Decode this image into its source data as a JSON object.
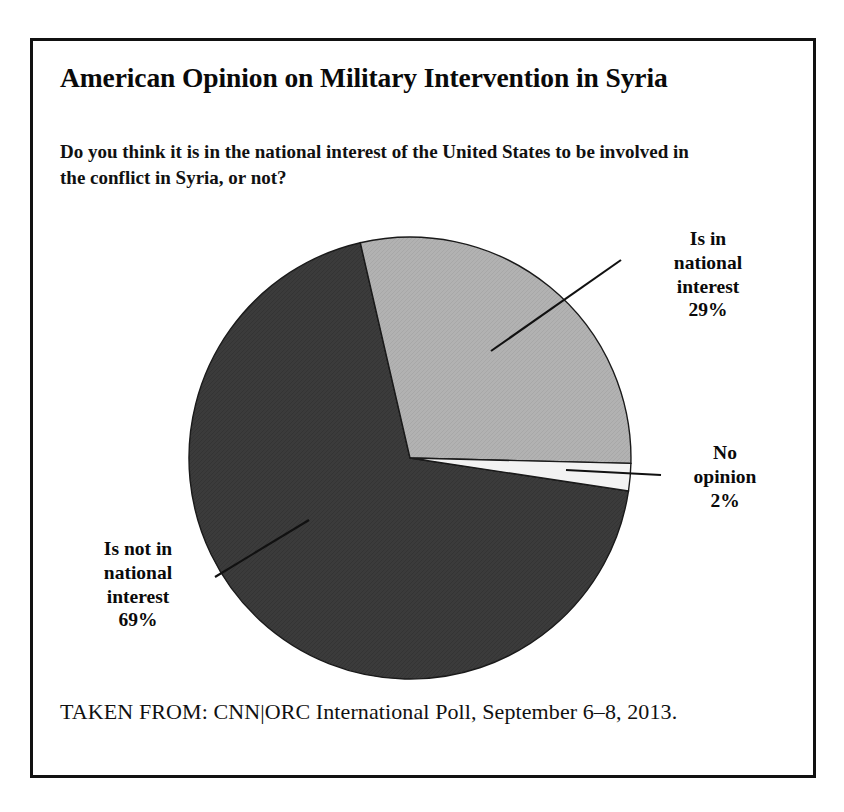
{
  "figure": {
    "title": "American Opinion on Military Intervention in Syria",
    "question": "Do you think it is in the national interest of the United States to be involved in the conflict in Syria, or not?",
    "source": "TAKEN FROM: CNN|ORC International Poll, September 6–8, 2013."
  },
  "labels": {
    "in_national_interest": "Is in\nnational\ninterest\n29%",
    "no_opinion": "No\nopinion\n2%",
    "not_in_national_interest": "Is not in\nnational\ninterest\n69%"
  },
  "colors": {
    "slice_in": "#b2b2b2",
    "slice_not_in": "#3b3b3b",
    "slice_no_opinion": "#f2f2f2",
    "outline": "#1a1a1a",
    "frame": "#111111",
    "text": "#0a0a0a",
    "background": "#ffffff"
  },
  "chart_data": {
    "type": "pie",
    "title": "American Opinion on Military Intervention in Syria",
    "subtitle": "Do you think it is in the national interest of the United States to be involved in the conflict in Syria, or not?",
    "unit": "percent",
    "total": 100,
    "categories": [
      "Is in national interest",
      "Is not in national interest",
      "No opinion"
    ],
    "values": [
      29,
      69,
      2
    ],
    "slices": [
      {
        "label": "Is in national interest",
        "value": 29,
        "display": "29%",
        "color": "#b2b2b2",
        "start_angle_deg": -13,
        "sweep_deg": 104.4
      },
      {
        "label": "No opinion",
        "value": 2,
        "display": "2%",
        "color": "#f2f2f2",
        "start_angle_deg": 91.4,
        "sweep_deg": 7.2
      },
      {
        "label": "Is not in national interest",
        "value": 69,
        "display": "69%",
        "color": "#3b3b3b",
        "start_angle_deg": 98.6,
        "sweep_deg": 248.4
      }
    ],
    "legend": "none",
    "labels_position": "outside-with-leader-lines",
    "grid": false,
    "source": "CNN|ORC International Poll, September 6–8, 2013."
  }
}
